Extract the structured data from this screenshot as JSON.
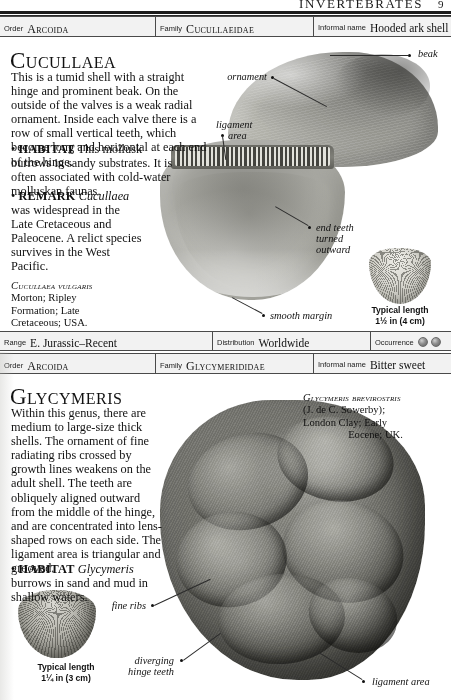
{
  "running_head": {
    "title": "INVERTEBRATES",
    "page_number": "9"
  },
  "entries": [
    {
      "classification": {
        "order_label": "Order",
        "order_value": "Arcoida",
        "family_label": "Family",
        "family_value": "Cucullaeidae",
        "informal_label": "Informal name",
        "informal_value": "Hooded ark shell"
      },
      "genus": "Cucullaea",
      "description": "This is a tumid shell with a straight hinge and prominent beak. On the outside of the valves is a weak radial ornament. Inside each valve there is a row of small vertical teeth, which become long and horizontal at each end of the hinge.",
      "habitat_label": "HABITAT",
      "habitat_text": "This mollusk burrows in sandy substrates. It is often associated with cold-water molluskan faunas.",
      "remark_label": "REMARK",
      "remark_genus": "Cucullaea",
      "remark_text": "was widespread in the Late Cretaceous and Paleocene. A relict species survives in the West Pacific.",
      "specimen_caption": {
        "species": "Cucullaea vulgaris",
        "line2": "Morton; Ripley",
        "line3": "Formation; Late",
        "line4": "Cretaceous; USA."
      },
      "typical_length": {
        "label": "Typical length",
        "value": "1½ in (4 cm)"
      },
      "callouts": [
        {
          "name": "beak",
          "text": "beak"
        },
        {
          "name": "ornament",
          "text": "ornament"
        },
        {
          "name": "ligament-area",
          "text": "ligament\narea"
        },
        {
          "name": "end-teeth",
          "text": "end teeth\nturned\noutward"
        },
        {
          "name": "smooth-margin",
          "text": "smooth margin"
        }
      ],
      "range_bar": {
        "range_label": "Range",
        "range_value": "E. Jurassic–Recent",
        "distribution_label": "Distribution",
        "distribution_value": "Worldwide",
        "occurrence_label": "Occurrence",
        "occurrence_count": 2
      }
    },
    {
      "classification": {
        "order_label": "Order",
        "order_value": "Arcoida",
        "family_label": "Family",
        "family_value": "Glycymerididae",
        "informal_label": "Informal name",
        "informal_value": "Bitter sweet"
      },
      "genus": "Glycymeris",
      "description": "Within this genus, there are medium to large-size thick shells. The ornament of fine radiating ribs crossed by growth lines weakens on the adult shell. The teeth are obliquely aligned outward from the middle of the hinge, and are concentrated into lens-shaped rows on each side. The ligament area is triangular and grooved.",
      "habitat_label": "HABITAT",
      "habitat_genus": "Glycymeris",
      "habitat_text": "burrows in sand and mud in shallow waters.",
      "specimen_caption": {
        "species": "Glycymeris brevirostris",
        "line2": "(J. de C. Sowerby);",
        "line3": "London Clay; Early",
        "line4": "Eocene; UK."
      },
      "typical_length": {
        "label": "Typical length",
        "value": "1¼ in (3 cm)"
      },
      "callouts": [
        {
          "name": "fine-ribs",
          "text": "fine ribs"
        },
        {
          "name": "diverging-hinge-teeth",
          "text": "diverging\nhinge teeth"
        },
        {
          "name": "ligament-area",
          "text": "ligament area"
        }
      ]
    }
  ]
}
